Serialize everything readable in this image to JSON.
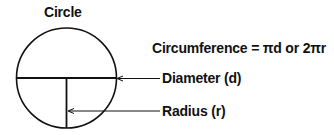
{
  "title": "Circle",
  "labels": {
    "circumference": "Circumference = πd or 2πr",
    "diameter": "Diameter (d)",
    "radius": "Radius (r)"
  },
  "colors": {
    "stroke": "#111111",
    "background": "#ffffff"
  }
}
